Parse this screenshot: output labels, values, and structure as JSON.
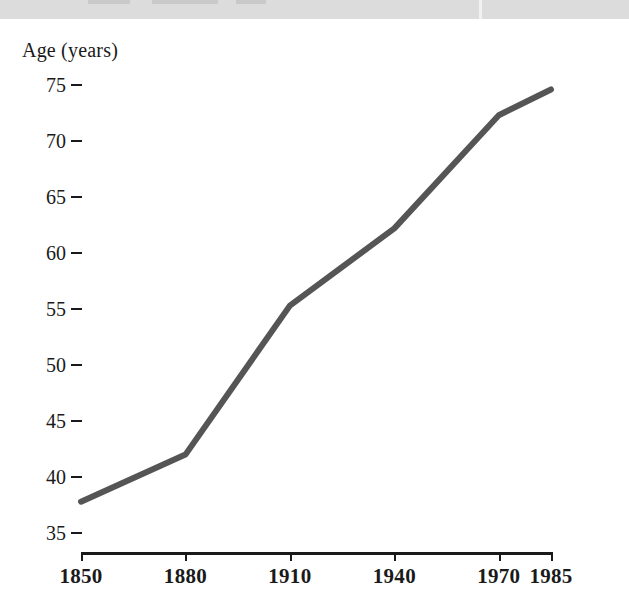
{
  "header_band": {
    "visible": true,
    "color": "#dcdcdc",
    "note": "cut-off page header strip"
  },
  "chart_data": {
    "type": "line",
    "title": "",
    "subtitle": "",
    "xlabel": "",
    "ylabel": "Age (years)",
    "grid": false,
    "legend": "none",
    "line_color": "#555555",
    "line_width": 6,
    "x": [
      1850,
      1880,
      1910,
      1940,
      1970,
      1985
    ],
    "categories": [
      "1850",
      "1880",
      "1910",
      "1940",
      "1970",
      "1985"
    ],
    "values": [
      37.8,
      42.0,
      55.3,
      62.2,
      72.3,
      74.6
    ],
    "series": [
      {
        "name": "Life expectancy",
        "values": [
          37.8,
          42.0,
          55.3,
          62.2,
          72.3,
          74.6
        ]
      }
    ],
    "xlim": [
      1850,
      1985
    ],
    "ylim": [
      34.0,
      76.5
    ],
    "ytick_values": [
      35,
      40,
      45,
      50,
      55,
      60,
      65,
      70,
      75
    ],
    "ytick_labels": [
      "35",
      "40",
      "45",
      "50",
      "55",
      "60",
      "65",
      "70",
      "75"
    ],
    "xtick_labels": [
      "1850",
      "1880",
      "1910",
      "1940",
      "1970",
      "1985"
    ]
  },
  "axis": {
    "y_title": "Age (years)",
    "ticks_y": [
      {
        "label": "75",
        "value": 75
      },
      {
        "label": "70",
        "value": 70
      },
      {
        "label": "65",
        "value": 65
      },
      {
        "label": "60",
        "value": 60
      },
      {
        "label": "55",
        "value": 55
      },
      {
        "label": "50",
        "value": 50
      },
      {
        "label": "45",
        "value": 45
      },
      {
        "label": "40",
        "value": 40
      },
      {
        "label": "35",
        "value": 35
      }
    ],
    "ticks_x": [
      {
        "label": "1850",
        "value": 1850
      },
      {
        "label": "1880",
        "value": 1880
      },
      {
        "label": "1910",
        "value": 1910
      },
      {
        "label": "1940",
        "value": 1940
      },
      {
        "label": "1970",
        "value": 1970
      },
      {
        "label": "1985",
        "value": 1985
      }
    ]
  }
}
